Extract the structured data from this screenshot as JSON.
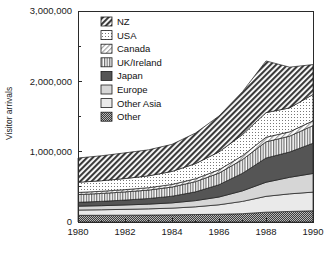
{
  "chart_data": {
    "type": "area",
    "title": "",
    "xlabel": "",
    "ylabel": "Visitor arrivals",
    "stacked": true,
    "grid": false,
    "legend_position": "top-left-inside",
    "x": [
      1980,
      1981,
      1982,
      1983,
      1984,
      1985,
      1986,
      1987,
      1988,
      1989,
      1990
    ],
    "xlim": [
      1980,
      1990
    ],
    "ylim": [
      0,
      3000000
    ],
    "x_tick_labels": [
      "1980",
      "1982",
      "1984",
      "1986",
      "1988",
      "1990"
    ],
    "x_tick_values": [
      1980,
      1982,
      1984,
      1986,
      1988,
      1990
    ],
    "x_minor_tick_values": [
      1981,
      1983,
      1985,
      1987,
      1989
    ],
    "y_tick_labels": [
      "0",
      "1,000,000",
      "2,000,000",
      "3,000,000"
    ],
    "y_tick_values": [
      0,
      1000000,
      2000000,
      3000000
    ],
    "y_minor_tick_values": [
      500000,
      1500000,
      2500000
    ],
    "stack_order_bottom_to_top": [
      "Other",
      "Other Asia",
      "Europe",
      "Japan",
      "UK/Ireland",
      "Canada",
      "USA",
      "NZ"
    ],
    "series": [
      {
        "name": "Other",
        "pattern": "dense-checker-dark",
        "color": "#4a4a4a",
        "values": [
          95000,
          96000,
          97000,
          99000,
          102000,
          106000,
          110000,
          118000,
          140000,
          150000,
          160000
        ]
      },
      {
        "name": "Other Asia",
        "pattern": "solid-very-light",
        "color": "#e8e8e8",
        "values": [
          75000,
          78000,
          83000,
          88000,
          95000,
          110000,
          135000,
          175000,
          225000,
          250000,
          265000
        ]
      },
      {
        "name": "Europe",
        "pattern": "solid-light",
        "color": "#d4d4d4",
        "values": [
          55000,
          58000,
          62000,
          67000,
          75000,
          88000,
          110000,
          150000,
          200000,
          235000,
          265000
        ]
      },
      {
        "name": "Japan",
        "pattern": "solid-dark",
        "color": "#555555",
        "values": [
          55000,
          62000,
          70000,
          80000,
          95000,
          125000,
          175000,
          250000,
          345000,
          360000,
          430000
        ]
      },
      {
        "name": "UK/Ireland",
        "pattern": "vertical-lines",
        "color": "#cfcfcf",
        "values": [
          110000,
          112000,
          116000,
          120000,
          130000,
          145000,
          165000,
          195000,
          230000,
          225000,
          250000
        ]
      },
      {
        "name": "Canada",
        "pattern": "diagonal-light",
        "color": "#bdbdbd",
        "values": [
          30000,
          31000,
          32000,
          34000,
          37000,
          41000,
          47000,
          55000,
          65000,
          62000,
          68000
        ]
      },
      {
        "name": "USA",
        "pattern": "fine-dots",
        "color": "#f0f0f0",
        "values": [
          145000,
          150000,
          158000,
          168000,
          185000,
          215000,
          255000,
          300000,
          350000,
          340000,
          375000
        ]
      },
      {
        "name": "NZ",
        "pattern": "diagonal-dark",
        "color": "#6e6e6e",
        "values": [
          345000,
          355000,
          365000,
          370000,
          385000,
          435000,
          510000,
          610000,
          735000,
          580000,
          425000
        ]
      }
    ],
    "totals": [
      910000,
      942000,
      983000,
      1026000,
      1104000,
      1265000,
      1507000,
      1853000,
      2290000,
      2202000,
      2238000
    ]
  },
  "legend": {
    "items": [
      {
        "label": "NZ"
      },
      {
        "label": "USA"
      },
      {
        "label": "Canada"
      },
      {
        "label": "UK/Ireland"
      },
      {
        "label": "Japan"
      },
      {
        "label": "Europe"
      },
      {
        "label": "Other Asia"
      },
      {
        "label": "Other"
      }
    ]
  },
  "axes": {
    "y_title": "Visitor arrivals"
  }
}
